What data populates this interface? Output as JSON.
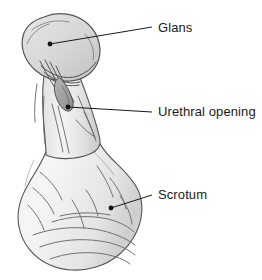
{
  "figure": {
    "style": "grayscale line drawing",
    "background_color": "#ffffff"
  },
  "callouts": [
    {
      "id": "glans",
      "label": "Glans",
      "label_x": 158,
      "label_y": 21,
      "dot_x": 50,
      "dot_y": 44,
      "line_bend_x": 152,
      "line_bend_y": 27
    },
    {
      "id": "urethral-opening",
      "label": "Urethral opening",
      "label_x": 158,
      "label_y": 105,
      "dot_x": 68,
      "dot_y": 107,
      "line_bend_x": 152,
      "line_bend_y": 112
    },
    {
      "id": "scrotum",
      "label": "Scrotum",
      "label_x": 158,
      "label_y": 188,
      "dot_x": 111,
      "dot_y": 208,
      "line_bend_x": 152,
      "line_bend_y": 195
    }
  ],
  "colors": {
    "outline": "#4a4a4a",
    "interior_light": "#f2f2f2",
    "interior_mid": "#dcdcdc",
    "interior_dark": "#c4c4c4",
    "shadow": "#b0b0b0",
    "urethra_dark": "#8f8f8f",
    "leader_line": "#1a1a1a",
    "text": "#1a1a1a"
  }
}
